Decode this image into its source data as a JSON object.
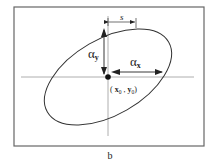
{
  "diagram": {
    "caption": "b",
    "colors": {
      "frame": "#555555",
      "line": "#333333",
      "axis": "#888888",
      "text": "#222222",
      "background": "#ffffff"
    },
    "frame": {
      "x": 14,
      "y": 7,
      "width": 190,
      "height": 139
    },
    "axes": {
      "horizontal": {
        "x1": 21,
        "x2": 194,
        "y": 77
      },
      "vertical": {
        "x": 108,
        "y1": 16,
        "y2": 136
      }
    },
    "ellipse": {
      "cx": 108,
      "cy": 77,
      "rx": 70,
      "ry": 38,
      "rotation_deg": -30
    },
    "center_point": {
      "x": 108,
      "y": 77,
      "label_x": "x",
      "label_y": "y",
      "label_sub": "0",
      "label": "(x0 , y0)"
    },
    "alpha_x": {
      "symbol": "α",
      "sub": "x",
      "x1": 110,
      "x2": 162,
      "y": 72
    },
    "alpha_y": {
      "symbol": "α",
      "sub": "y",
      "x": 104,
      "y1": 28,
      "y2": 75
    },
    "s": {
      "label": "s",
      "x1": 108,
      "x2": 136,
      "y": 22
    }
  }
}
